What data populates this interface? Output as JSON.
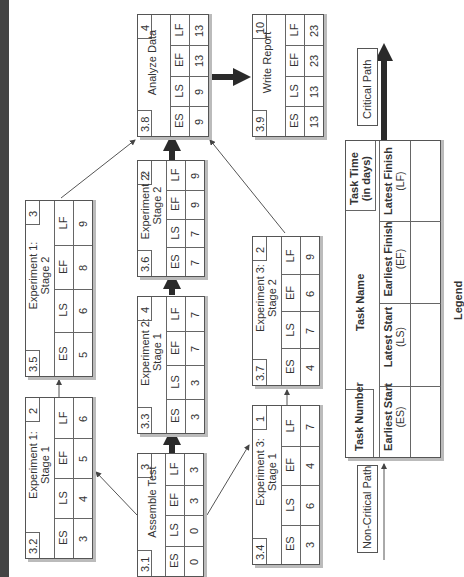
{
  "legend": {
    "title": "Legend",
    "task_number": "Task Number",
    "task_name": "Task Name",
    "task_time": [
      "Task Time",
      "(in days)"
    ],
    "fields": [
      {
        "label": "Earliest Start",
        "abbr": "(ES)"
      },
      {
        "label": "Latest Start",
        "abbr": "(LS)"
      },
      {
        "label": "Earliest Finish",
        "abbr": "(EF)"
      },
      {
        "label": "Latest Finish",
        "abbr": "(LF)"
      }
    ],
    "critical_path": "Critical Path",
    "non_critical_path": "Non-Critical Path"
  },
  "field_headers": [
    "ES",
    "LS",
    "EF",
    "LF"
  ],
  "tasks": [
    {
      "id": "3.1",
      "name": [
        "Assemble Test"
      ],
      "duration": "3",
      "es": "0",
      "ls": "0",
      "ef": "3",
      "lf": "3"
    },
    {
      "id": "3.2",
      "name": [
        "Experiment 1:",
        "Stage 1"
      ],
      "duration": "2",
      "es": "3",
      "ls": "4",
      "ef": "5",
      "lf": "6"
    },
    {
      "id": "3.3",
      "name": [
        "Experiment 2:",
        "Stage 1"
      ],
      "duration": "4",
      "es": "3",
      "ls": "3",
      "ef": "7",
      "lf": "7"
    },
    {
      "id": "3.4",
      "name": [
        "Experiment 3:",
        "Stage 1"
      ],
      "duration": "1",
      "es": "3",
      "ls": "6",
      "ef": "4",
      "lf": "7"
    },
    {
      "id": "3.5",
      "name": [
        "Experiment 1:",
        "Stage 2"
      ],
      "duration": "3",
      "es": "5",
      "ls": "6",
      "ef": "8",
      "lf": "9"
    },
    {
      "id": "3.6",
      "name": [
        "Experiment 2:",
        "Stage 2"
      ],
      "duration": "2",
      "es": "7",
      "ls": "7",
      "ef": "9",
      "lf": "9"
    },
    {
      "id": "3.7",
      "name": [
        "Experiment 3:",
        "Stage 2"
      ],
      "duration": "2",
      "es": "4",
      "ls": "7",
      "ef": "6",
      "lf": "9"
    },
    {
      "id": "3.8",
      "name": [
        "Analyze Data"
      ],
      "duration": "4",
      "es": "9",
      "ls": "9",
      "ef": "13",
      "lf": "13"
    },
    {
      "id": "3.9",
      "name": [
        "Write Report"
      ],
      "duration": "10",
      "es": "13",
      "ls": "13",
      "ef": "23",
      "lf": "23"
    }
  ],
  "dependencies": [
    {
      "from": "3.1",
      "to": "3.2",
      "critical": false
    },
    {
      "from": "3.1",
      "to": "3.3",
      "critical": true
    },
    {
      "from": "3.1",
      "to": "3.4",
      "critical": false
    },
    {
      "from": "3.2",
      "to": "3.5",
      "critical": false
    },
    {
      "from": "3.3",
      "to": "3.6",
      "critical": true
    },
    {
      "from": "3.4",
      "to": "3.7",
      "critical": false
    },
    {
      "from": "3.5",
      "to": "3.8",
      "critical": false
    },
    {
      "from": "3.6",
      "to": "3.8",
      "critical": true
    },
    {
      "from": "3.7",
      "to": "3.8",
      "critical": false
    },
    {
      "from": "3.8",
      "to": "3.9",
      "critical": true
    }
  ],
  "colors": {
    "line": "#555555",
    "critical": "#2a2a2a",
    "shadow": "#bbbbbb",
    "strip": "#444444"
  }
}
